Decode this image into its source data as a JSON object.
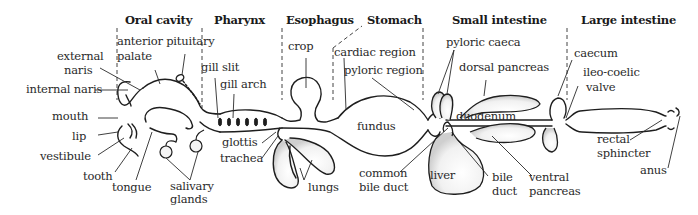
{
  "colors": {
    "stroke": "#1e1e1e",
    "text": "#2a2a2a",
    "shade": "#d8d8d8",
    "background": "#ffffff"
  },
  "sections": [
    {
      "id": "oral-cavity",
      "label": "Oral cavity"
    },
    {
      "id": "pharynx",
      "label": "Pharynx"
    },
    {
      "id": "esophagus",
      "label": "Esophagus"
    },
    {
      "id": "stomach",
      "label": "Stomach"
    },
    {
      "id": "small-intestine",
      "label": "Small intestine"
    },
    {
      "id": "large-intestine",
      "label": "Large intestine"
    }
  ],
  "labels": {
    "anterior_pituitary": "anterior pituitary",
    "palate": "palate",
    "external_naris_1": "external",
    "external_naris_2": "naris",
    "internal_naris": "internal naris",
    "mouth": "mouth",
    "lip": "lip",
    "vestibule": "vestibule",
    "tooth": "tooth",
    "tongue": "tongue",
    "salivary_glands_1": "salivary",
    "salivary_glands_2": "glands",
    "gill_slit": "gill slit",
    "gill_arch": "gill arch",
    "glottis": "glottis",
    "trachea": "trachea",
    "lungs": "lungs",
    "crop": "crop",
    "cardiac_region": "cardiac region",
    "pyloric_region": "pyloric region",
    "fundus": "fundus",
    "common_bile_duct_1": "common",
    "common_bile_duct_2": "bile duct",
    "pyloric_caeca": "pyloric caeca",
    "dorsal_pancreas": "dorsal pancreas",
    "duodenum": "duodenum",
    "liver": "liver",
    "bile_duct_1": "bile",
    "bile_duct_2": "duct",
    "ventral_pancreas_1": "ventral",
    "ventral_pancreas_2": "pancreas",
    "caecum": "caecum",
    "ileo_coelic_valve_1": "ileo-coelic",
    "ileo_coelic_valve_2": "valve",
    "rectal_sphincter_1": "rectal",
    "rectal_sphincter_2": "sphincter",
    "anus": "anus"
  }
}
